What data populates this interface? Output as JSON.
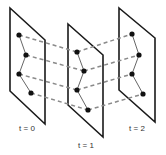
{
  "diagram": {
    "colors": {
      "frame": "#1a1a1a",
      "track": "#8a8a8a",
      "chain": "#555555",
      "node": "#111111",
      "label": "#333333"
    },
    "frames": [
      {
        "label": "t = 0",
        "corners": [
          [
            10,
            8
          ],
          [
            45,
            40
          ],
          [
            45,
            124
          ],
          [
            10,
            91
          ]
        ],
        "nodes": [
          [
            19,
            35
          ],
          [
            26,
            55
          ],
          [
            19,
            74
          ],
          [
            31,
            93
          ]
        ],
        "label_pos": [
          27,
          131
        ]
      },
      {
        "label": "t = 1",
        "corners": [
          [
            68,
            24
          ],
          [
            103,
            55
          ],
          [
            103,
            137
          ],
          [
            68,
            105
          ]
        ],
        "nodes": [
          [
            77,
            52
          ],
          [
            84,
            71
          ],
          [
            77,
            90
          ],
          [
            88,
            110
          ]
        ],
        "label_pos": [
          86,
          148
        ]
      },
      {
        "label": "t = 2",
        "corners": [
          [
            119,
            8
          ],
          [
            155,
            38
          ],
          [
            155,
            122
          ],
          [
            119,
            90
          ]
        ],
        "nodes": [
          [
            132,
            34
          ],
          [
            139,
            55
          ],
          [
            132,
            74
          ],
          [
            143,
            94
          ]
        ],
        "label_pos": [
          137,
          131
        ]
      }
    ]
  }
}
